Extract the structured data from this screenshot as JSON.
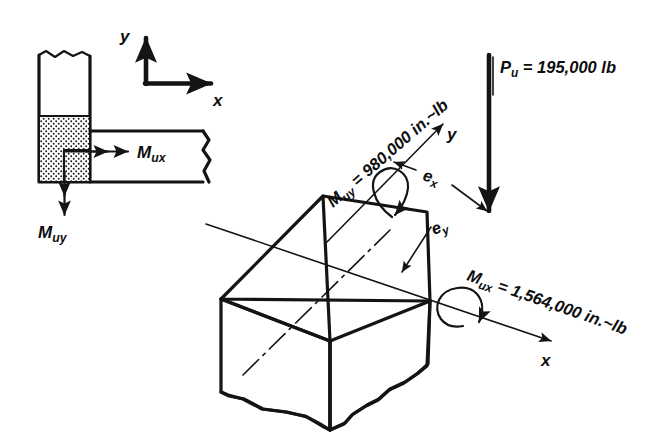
{
  "figure": {
    "background_color": "#ffffff",
    "ink_color": "#141414"
  },
  "plan_view": {
    "name": "corner-column-plan-view",
    "column_label": "hatched-column-section",
    "beam_label": "beam-stub",
    "moment_x": {
      "symbol": "M",
      "subscript": "ux",
      "text": "M",
      "sub": "ux",
      "direction": "right"
    },
    "moment_y": {
      "symbol": "M",
      "subscript": "uy",
      "text": "M",
      "sub": "uy",
      "direction": "down"
    }
  },
  "plan_axes": {
    "x_label": "x",
    "y_label": "y"
  },
  "iso_view": {
    "name": "isometric-column",
    "axis_x_label": "x",
    "axis_y_label": "y",
    "eccentricity_x": {
      "text": "e",
      "sub": "x"
    },
    "eccentricity_y": {
      "text": "e",
      "sub": "y"
    },
    "load": {
      "symbol": "P",
      "sub": "u",
      "equals": " = ",
      "value": "195,000 lb",
      "full": "P_u = 195,000 lb"
    },
    "moment_uy": {
      "symbol": "M",
      "sub": "uy",
      "equals": " = ",
      "value": "980,000 in.~lb",
      "full": "M_uy = 980,000 in.~lb"
    },
    "moment_ux": {
      "symbol": "M",
      "sub": "ux",
      "equals": " = ",
      "value": "1,564,000 in.~lb",
      "full": "M_ux = 1,564,000 in.~lb"
    }
  }
}
